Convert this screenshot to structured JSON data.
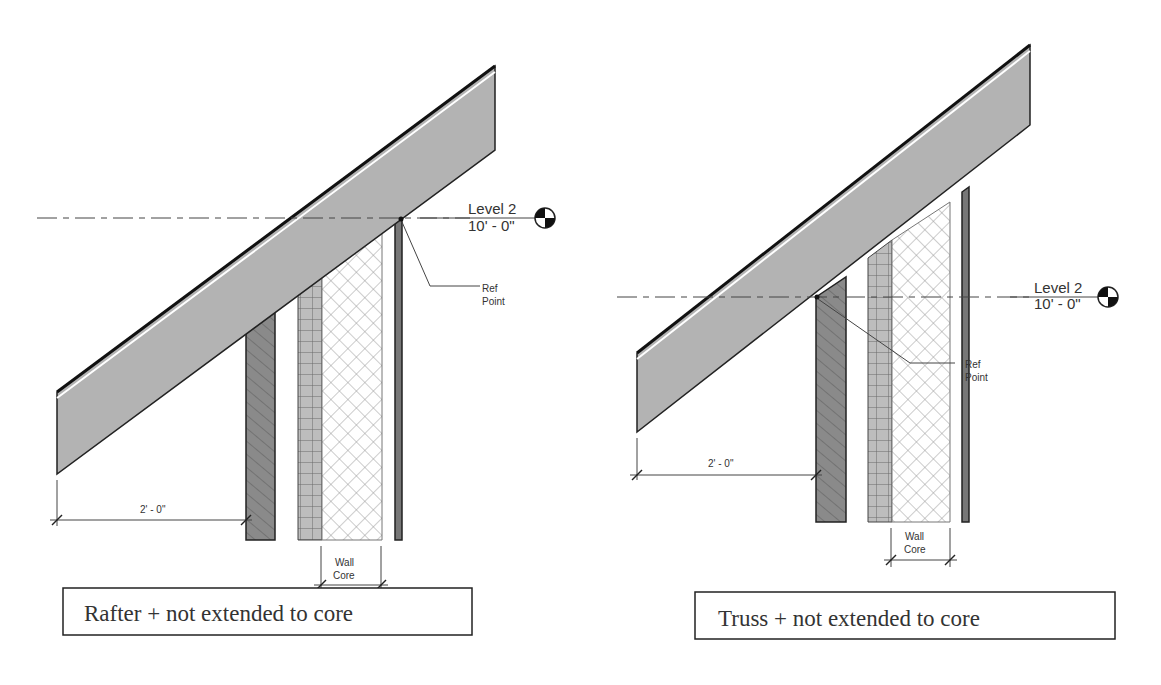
{
  "diagrams": [
    {
      "caption": "Rafter + not extended to core",
      "level": {
        "name": "Level 2",
        "elevation": "10' - 0\""
      },
      "ref_point_label": [
        "Ref",
        "Point"
      ],
      "overhang_dim": "2' - 0\"",
      "core_dim_label": [
        "Wall",
        "Core"
      ]
    },
    {
      "caption": "Truss + not extended to core",
      "level": {
        "name": "Level 2",
        "elevation": "10' - 0\""
      },
      "ref_point_label": [
        "Ref",
        "Point"
      ],
      "overhang_dim": "2' - 0\"",
      "core_dim_label": [
        "Wall",
        "Core"
      ]
    }
  ],
  "colors": {
    "roof_fill": "#b3b3b3",
    "hatch_fill": "#8a8a8a",
    "grid_fill": "#b8b8b8",
    "line": "#222222"
  }
}
